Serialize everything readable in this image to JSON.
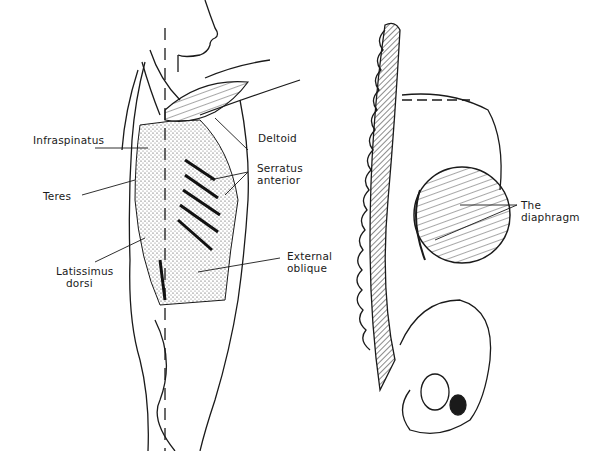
{
  "figure": {
    "left_panel": {
      "description": "Side view of torso showing back and side muscles",
      "labels": {
        "deltoid": "Deltoid",
        "infraspinatus": "Infraspinatus",
        "serratus_line1": "Serratus",
        "serratus_line2": "anterior",
        "teres": "Teres",
        "external_line1": "External",
        "external_line2": "oblique",
        "latissimus_line1": "Latissimus",
        "latissimus_line2": "dorsi"
      }
    },
    "right_panel": {
      "description": "Side view of spine, rib cage and pelvis showing the diaphragm",
      "labels": {
        "diaphragm_line1": "The",
        "diaphragm_line2": "diaphragm"
      }
    },
    "colors": {
      "ink": "#1a1a1a",
      "background": "#ffffff"
    }
  }
}
